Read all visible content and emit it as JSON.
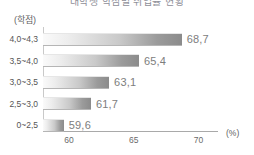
{
  "chart_data": {
    "type": "bar",
    "orientation": "horizontal",
    "title": "대학생 학점별 취업률 현황",
    "title_visible": false,
    "categories": [
      "4,0~4,3",
      "3,5~4,0",
      "3,0~3,5",
      "2,5~3,0",
      "0~2,5"
    ],
    "values": [
      68.7,
      65.4,
      63.1,
      61.7,
      59.6
    ],
    "value_labels": [
      "68,7",
      "65,4",
      "63,1",
      "61,7",
      "59,6"
    ],
    "xlabel": "(%)",
    "ylabel": "(학점)",
    "xlim": [
      58.0,
      71.5
    ],
    "xticks": [
      60,
      65,
      70
    ],
    "xtick_labels": [
      "60",
      "65",
      "70"
    ],
    "grid": false,
    "legend": false,
    "bar_gradient_start": "#fafafa",
    "bar_gradient_end": "#8b8b8b",
    "axis_color": "#a9a9a9",
    "label_color": "#7d7d7d"
  }
}
